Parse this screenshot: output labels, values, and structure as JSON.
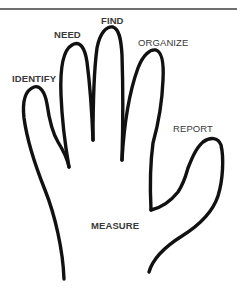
{
  "diagram": {
    "type": "hand-outline",
    "labels": {
      "thumb": "IDENTIFY",
      "index": "NEED",
      "middle": "FIND",
      "ring": "ORGANIZE",
      "pinky": "REPORT",
      "palm": "MEASURE"
    },
    "colors": {
      "outline": "#111111",
      "label": "#3a3a3a",
      "rule": "#6f6f6f",
      "background": "#ffffff"
    }
  }
}
